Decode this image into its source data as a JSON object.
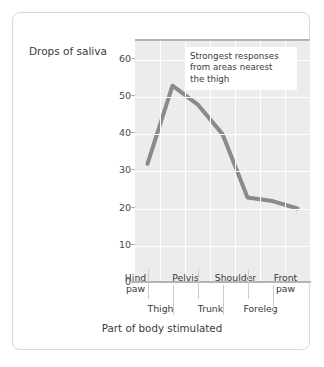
{
  "chart_data": {
    "type": "line",
    "title": "",
    "xlabel": "Part of body stimulated",
    "ylabel": "Drops of saliva",
    "categories": [
      "Hind paw",
      "Thigh",
      "Pelvis",
      "Trunk",
      "Shoulder",
      "Foreleg",
      "Front paw"
    ],
    "values": [
      32,
      53,
      48,
      40,
      23,
      22,
      20
    ],
    "ylim": [
      0,
      65
    ],
    "yticks": [
      "0",
      "10",
      "20",
      "30",
      "40",
      "50",
      "60"
    ],
    "ytick_values": [
      0,
      10,
      20,
      30,
      40,
      50,
      60
    ],
    "grid": true,
    "legend": "none",
    "line_color": "#8a8a8a",
    "plot_bg": "#ececec",
    "annotations": [
      {
        "text": "Strongest responses from areas nearest the thigh",
        "line1": "Strongest responses",
        "line2": "from areas nearest",
        "line3": "the thigh"
      }
    ]
  },
  "axis": {
    "y_title": "Drops of saliva",
    "x_title": "Part of body stimulated",
    "x_labels_upper": [
      "Hind paw",
      "Pelvis",
      "Shoulder",
      "Front paw"
    ],
    "x_labels_upper_split": [
      {
        "l1": "Hind",
        "l2": "paw"
      },
      {
        "l1": "Pelvis",
        "l2": ""
      },
      {
        "l1": "Shoulder",
        "l2": ""
      },
      {
        "l1": "Front",
        "l2": "paw"
      }
    ],
    "x_labels_lower": [
      "Thigh",
      "Trunk",
      "Foreleg"
    ]
  },
  "colors": {
    "card_border": "#ddd9d4",
    "plot_background": "#ececec",
    "gridline": "#ffffff",
    "axis_line": "#b4b4b4",
    "series_line": "#8a8a8a",
    "text": "#3a3a3a"
  }
}
